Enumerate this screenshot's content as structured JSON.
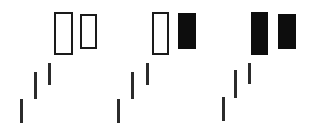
{
  "chart_data": {
    "type": "candlestick-diagram",
    "title": "",
    "subtitle": "",
    "xlabel": "",
    "ylabel": "",
    "grid": false,
    "legend": false,
    "background_color": "#ffffff",
    "bullish_color": "#ffffff",
    "bearish_color": "#0d0d0d",
    "outline_color": "#1a1a1a",
    "wick_color": "#2b2b2b",
    "canvas": {
      "width": 317,
      "height": 131
    },
    "groups": [
      {
        "name": "pattern-variant-1",
        "label": "",
        "candles": [
          {
            "name": "candle-1",
            "shape": "line",
            "fill": "none",
            "x": 20,
            "y": 99,
            "width": 3,
            "height": 24
          },
          {
            "name": "candle-2",
            "shape": "line",
            "fill": "none",
            "x": 34,
            "y": 72,
            "width": 3,
            "height": 27
          },
          {
            "name": "candle-3",
            "shape": "line",
            "fill": "none",
            "x": 48,
            "y": 63,
            "width": 3,
            "height": 22
          },
          {
            "name": "candle-4",
            "shape": "body",
            "fill": "hollow",
            "x": 54,
            "y": 12,
            "width": 19,
            "height": 43
          },
          {
            "name": "candle-5",
            "shape": "body",
            "fill": "hollow",
            "x": 80,
            "y": 14,
            "width": 17,
            "height": 35
          }
        ]
      },
      {
        "name": "pattern-variant-2",
        "label": "",
        "candles": [
          {
            "name": "candle-1",
            "shape": "line",
            "fill": "none",
            "x": 117,
            "y": 99,
            "width": 3,
            "height": 24
          },
          {
            "name": "candle-2",
            "shape": "line",
            "fill": "none",
            "x": 131,
            "y": 72,
            "width": 3,
            "height": 27
          },
          {
            "name": "candle-3",
            "shape": "line",
            "fill": "none",
            "x": 146,
            "y": 63,
            "width": 3,
            "height": 22
          },
          {
            "name": "candle-4",
            "shape": "body",
            "fill": "hollow",
            "x": 152,
            "y": 12,
            "width": 17,
            "height": 43
          },
          {
            "name": "candle-5",
            "shape": "body",
            "fill": "filled",
            "x": 178,
            "y": 13,
            "width": 18,
            "height": 36
          }
        ]
      },
      {
        "name": "pattern-variant-3",
        "label": "",
        "candles": [
          {
            "name": "candle-1",
            "shape": "line",
            "fill": "none",
            "x": 222,
            "y": 97,
            "width": 3,
            "height": 24
          },
          {
            "name": "candle-2",
            "shape": "line",
            "fill": "none",
            "x": 234,
            "y": 70,
            "width": 3,
            "height": 28
          },
          {
            "name": "candle-3",
            "shape": "line",
            "fill": "none",
            "x": 248,
            "y": 63,
            "width": 3,
            "height": 21
          },
          {
            "name": "candle-4",
            "shape": "body",
            "fill": "filled",
            "x": 251,
            "y": 12,
            "width": 17,
            "height": 43
          },
          {
            "name": "candle-5",
            "shape": "body",
            "fill": "filled",
            "x": 278,
            "y": 14,
            "width": 18,
            "height": 35
          }
        ]
      }
    ]
  }
}
